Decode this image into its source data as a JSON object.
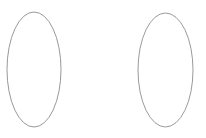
{
  "canvas": {
    "width": 206,
    "height": 138,
    "background_color": "#ffffff"
  },
  "figure": {
    "name": "two-ellipses-outline-figure",
    "shape_count": 2,
    "stroke_color": "#8c8c8c",
    "stroke_width": 0.9,
    "fill": "none",
    "shapes": [
      {
        "id": "ellipse-left",
        "kind": "ellipse",
        "cx": 34,
        "cy": 69.5,
        "rx": 27,
        "ry": 57.5,
        "stroke_color": "#8c8c8c",
        "stroke_width": 0.9,
        "fill": "none"
      },
      {
        "id": "ellipse-right",
        "kind": "ellipse",
        "cx": 165.5,
        "cy": 70,
        "rx": 27.5,
        "ry": 57,
        "stroke_color": "#8f8f8f",
        "stroke_width": 0.9,
        "fill": "none"
      }
    ]
  }
}
